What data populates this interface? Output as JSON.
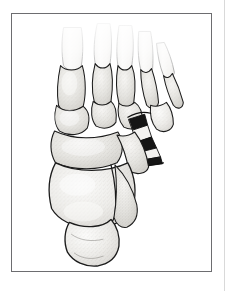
{
  "page": {
    "background_color": "#ffffff",
    "edge_line_color": "#d9d9d9",
    "caption": ""
  },
  "figure": {
    "kind": "anatomical-line-illustration",
    "view": "dorsal (superior) oblique view",
    "title": "",
    "caption": "",
    "frame": {
      "border_color": "#6d6d70",
      "fill_color": "#ffffff",
      "x": 11,
      "y": 13,
      "width": 201,
      "height": 259
    },
    "style": {
      "outline_color": "#1a1a1a",
      "bone_fill_light": "#f2f1ef",
      "bone_fill_mid": "#e3e2df",
      "bone_fill_shadow": "#cfcdc9",
      "stipple_color": "#8a8782",
      "highlight_color": "#fbfbfa",
      "fracture_fill": "#151515"
    },
    "annotations": {
      "fracture_site": "base of fifth metatarsal / cuboid articulation",
      "fracture_pattern": "comminuted wedge fragments shown in solid black"
    },
    "bones": [
      {
        "name": "distal-phalanges",
        "count": 5,
        "region": "toes",
        "shading": "faded at top edge"
      },
      {
        "name": "middle-phalanges",
        "count": 4,
        "region": "toes"
      },
      {
        "name": "proximal-phalanges",
        "count": 5,
        "region": "toes"
      },
      {
        "name": "first-metatarsal",
        "region": "medial forefoot"
      },
      {
        "name": "second-metatarsal",
        "region": "forefoot"
      },
      {
        "name": "third-metatarsal",
        "region": "forefoot"
      },
      {
        "name": "fourth-metatarsal",
        "region": "forefoot"
      },
      {
        "name": "fifth-metatarsal",
        "region": "lateral forefoot"
      },
      {
        "name": "medial-cuneiform",
        "region": "midfoot"
      },
      {
        "name": "intermediate-cuneiform",
        "region": "midfoot"
      },
      {
        "name": "lateral-cuneiform",
        "region": "midfoot"
      },
      {
        "name": "navicular",
        "region": "midfoot"
      },
      {
        "name": "cuboid",
        "region": "lateral midfoot"
      },
      {
        "name": "talus",
        "region": "hindfoot"
      },
      {
        "name": "calcaneus",
        "region": "hindfoot / heel"
      }
    ]
  }
}
